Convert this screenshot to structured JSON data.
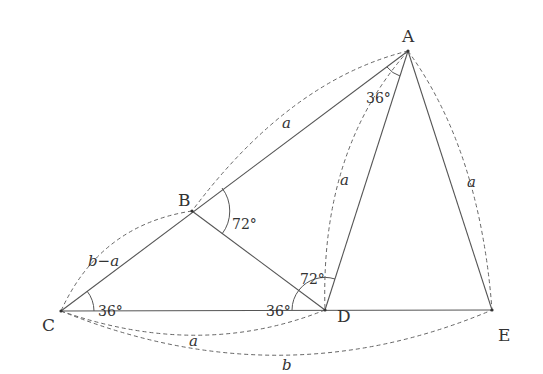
{
  "diagram": {
    "points": {
      "A": {
        "label": "A",
        "x": 408,
        "y": 51
      },
      "B": {
        "label": "B",
        "x": 192,
        "y": 211
      },
      "C": {
        "label": "C",
        "x": 61,
        "y": 311
      },
      "D": {
        "label": "D",
        "x": 325,
        "y": 310
      },
      "E": {
        "label": "E",
        "x": 492,
        "y": 310
      }
    },
    "segments": [
      "AC",
      "BD",
      "CE",
      "AD",
      "AE"
    ],
    "angles": {
      "angle_C": "36°",
      "angle_A": "36°",
      "angle_B": "72°",
      "angle_BDC": "36°",
      "angle_ADB": "72°"
    },
    "lengths": {
      "AB": "a",
      "BC": "b−a",
      "AD": "a",
      "AE": "a",
      "CD": "a",
      "CE": "b"
    },
    "colors": {
      "line": "#555555",
      "text": "#333333"
    }
  }
}
